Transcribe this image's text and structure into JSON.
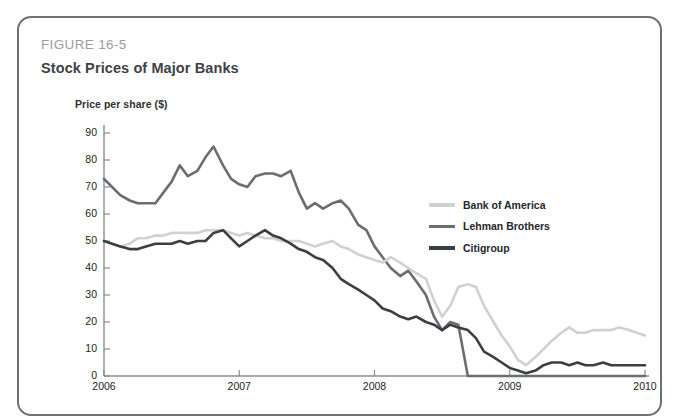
{
  "figure": {
    "label": "FIGURE 16-5",
    "title": "Stock Prices of Major Banks"
  },
  "legend": {
    "items": [
      {
        "label": "Bank of America",
        "color": "#d0d1d2",
        "swatch_name": "legend-swatch-bank-of-america"
      },
      {
        "label": "Lehman Brothers",
        "color": "#6b6e71",
        "swatch_name": "legend-swatch-lehman-brothers"
      },
      {
        "label": "Citigroup",
        "color": "#3c3f42",
        "swatch_name": "legend-swatch-citigroup"
      }
    ]
  },
  "chart_data": {
    "type": "line",
    "title": "Stock Prices of Major Banks",
    "xlabel": "",
    "ylabel": "Price per share ($)",
    "xlim": [
      2006,
      2010
    ],
    "ylim": [
      0,
      90
    ],
    "grid": false,
    "legend_position": "inside-right",
    "x_tick_labels": [
      "2006",
      "2007",
      "2008",
      "2009",
      "2010"
    ],
    "x_ticks": [
      2006,
      2007,
      2008,
      2009,
      2010
    ],
    "y_tick_labels": [
      "0",
      "10",
      "20",
      "30",
      "40",
      "50",
      "60",
      "70",
      "80",
      "90"
    ],
    "y_ticks": [
      0,
      10,
      20,
      30,
      40,
      50,
      60,
      70,
      80,
      90
    ],
    "x": [
      2006.0,
      2006.06,
      2006.12,
      2006.19,
      2006.25,
      2006.31,
      2006.38,
      2006.44,
      2006.5,
      2006.56,
      2006.62,
      2006.69,
      2006.75,
      2006.81,
      2006.88,
      2006.94,
      2007.0,
      2007.06,
      2007.12,
      2007.19,
      2007.25,
      2007.31,
      2007.38,
      2007.44,
      2007.5,
      2007.56,
      2007.62,
      2007.69,
      2007.75,
      2007.81,
      2007.88,
      2007.94,
      2008.0,
      2008.06,
      2008.12,
      2008.19,
      2008.25,
      2008.31,
      2008.38,
      2008.44,
      2008.5,
      2008.56,
      2008.62,
      2008.69,
      2008.75,
      2008.81,
      2008.88,
      2008.94,
      2009.0,
      2009.06,
      2009.12,
      2009.19,
      2009.25,
      2009.31,
      2009.38,
      2009.44,
      2009.5,
      2009.56,
      2009.62,
      2009.69,
      2009.75,
      2009.81,
      2009.88,
      2009.94,
      2010.0
    ],
    "series": [
      {
        "name": "Lehman Brothers",
        "color": "#6b6e71",
        "values": [
          73,
          70,
          67,
          65,
          64,
          64,
          64,
          68,
          72,
          78,
          74,
          76,
          81,
          85,
          78,
          73,
          71,
          70,
          74,
          75,
          75,
          74,
          76,
          68,
          62,
          64,
          62,
          64,
          65,
          62,
          56,
          54,
          48,
          44,
          40,
          37,
          39,
          35,
          30,
          22,
          17,
          20,
          19,
          0,
          0,
          0,
          0,
          0,
          0,
          0,
          0,
          0,
          0,
          0,
          0,
          0,
          0,
          0,
          0,
          0,
          0,
          0,
          0,
          0,
          0
        ]
      },
      {
        "name": "Bank of America",
        "color": "#d0d1d2",
        "values": [
          50,
          49,
          48,
          49,
          51,
          51,
          52,
          52,
          53,
          53,
          53,
          53,
          54,
          54,
          54,
          53,
          52,
          53,
          52,
          51,
          51,
          50,
          50,
          50,
          49,
          48,
          49,
          50,
          48,
          47,
          45,
          44,
          43,
          42,
          44,
          42,
          40,
          38,
          36,
          28,
          22,
          26,
          33,
          34,
          33,
          26,
          20,
          15,
          11,
          6,
          4,
          7,
          10,
          13,
          16,
          18,
          16,
          16,
          17,
          17,
          17,
          18,
          17,
          16,
          15
        ]
      },
      {
        "name": "Citigroup",
        "color": "#3c3f42",
        "values": [
          50,
          49,
          48,
          47,
          47,
          48,
          49,
          49,
          49,
          50,
          49,
          50,
          50,
          53,
          54,
          51,
          48,
          50,
          52,
          54,
          52,
          51,
          49,
          47,
          46,
          44,
          43,
          40,
          36,
          34,
          32,
          30,
          28,
          25,
          24,
          22,
          21,
          22,
          20,
          19,
          17,
          19,
          18,
          17,
          14,
          9,
          7,
          5,
          3,
          2,
          1,
          2,
          4,
          5,
          5,
          4,
          5,
          4,
          4,
          5,
          4,
          4,
          4,
          4,
          4
        ]
      }
    ]
  }
}
